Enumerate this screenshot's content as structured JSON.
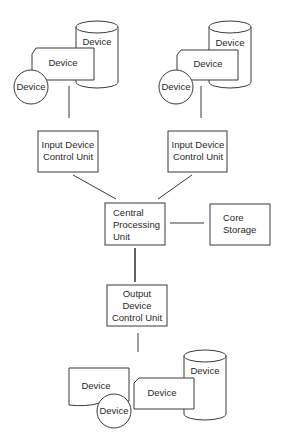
{
  "diagram": {
    "type": "computer-system-block-diagram",
    "colors": {
      "stroke": "#3a3a3a",
      "text": "#2a2a2a",
      "background": "#ffffff"
    },
    "input_groups": [
      {
        "id": "left",
        "devices": {
          "drum": "Device",
          "card": "Device",
          "disk": "Device"
        },
        "control_unit": {
          "line1": "Input Device",
          "line2": "Control Unit"
        }
      },
      {
        "id": "right",
        "devices": {
          "drum": "Device",
          "card": "Device",
          "disk": "Device"
        },
        "control_unit": {
          "line1": "Input Device",
          "line2": "Control Unit"
        }
      }
    ],
    "cpu": {
      "line1": "Central",
      "line2": "Processing",
      "line3": "Unit"
    },
    "storage": {
      "line1": "Core",
      "line2": "Storage"
    },
    "output_control_unit": {
      "line1": "Output",
      "line2": "Device",
      "line3": "Control Unit"
    },
    "output_devices": {
      "document": "Device",
      "card": "Device",
      "disk": "Device",
      "drum": "Device"
    },
    "connections": [
      [
        "Input Device Control Unit (left)",
        "Central Processing Unit"
      ],
      [
        "Input Device Control Unit (right)",
        "Central Processing Unit"
      ],
      [
        "Central Processing Unit",
        "Core Storage"
      ],
      [
        "Central Processing Unit",
        "Output Device Control Unit"
      ],
      [
        "Output Device Control Unit",
        "Output Devices"
      ]
    ]
  }
}
